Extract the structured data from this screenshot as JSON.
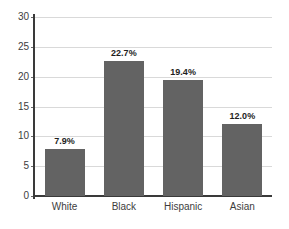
{
  "chart_data": {
    "type": "bar",
    "title": "",
    "subtitle": "",
    "xlabel": "",
    "ylabel": "",
    "categories": [
      "White",
      "Black",
      "Hispanic",
      "Asian"
    ],
    "values": [
      7.9,
      22.7,
      19.4,
      12.0
    ],
    "data_labels": [
      "7.9%",
      "22.7%",
      "19.4%",
      "12.0%"
    ],
    "ylim": [
      0,
      30
    ],
    "yticks": [
      0,
      5,
      10,
      15,
      20,
      25,
      30
    ],
    "ytick_labels": [
      "0",
      "5",
      "10",
      "15",
      "20",
      "25",
      "30"
    ],
    "grid": true,
    "grid_axis": "y",
    "legend": false,
    "legend_position": "none",
    "bar_color": "#636363",
    "axis_color": "#3a3a3a",
    "grid_color": "#d9d9d9",
    "label_color": "#1e1e1e",
    "background_color": "#ffffff"
  }
}
